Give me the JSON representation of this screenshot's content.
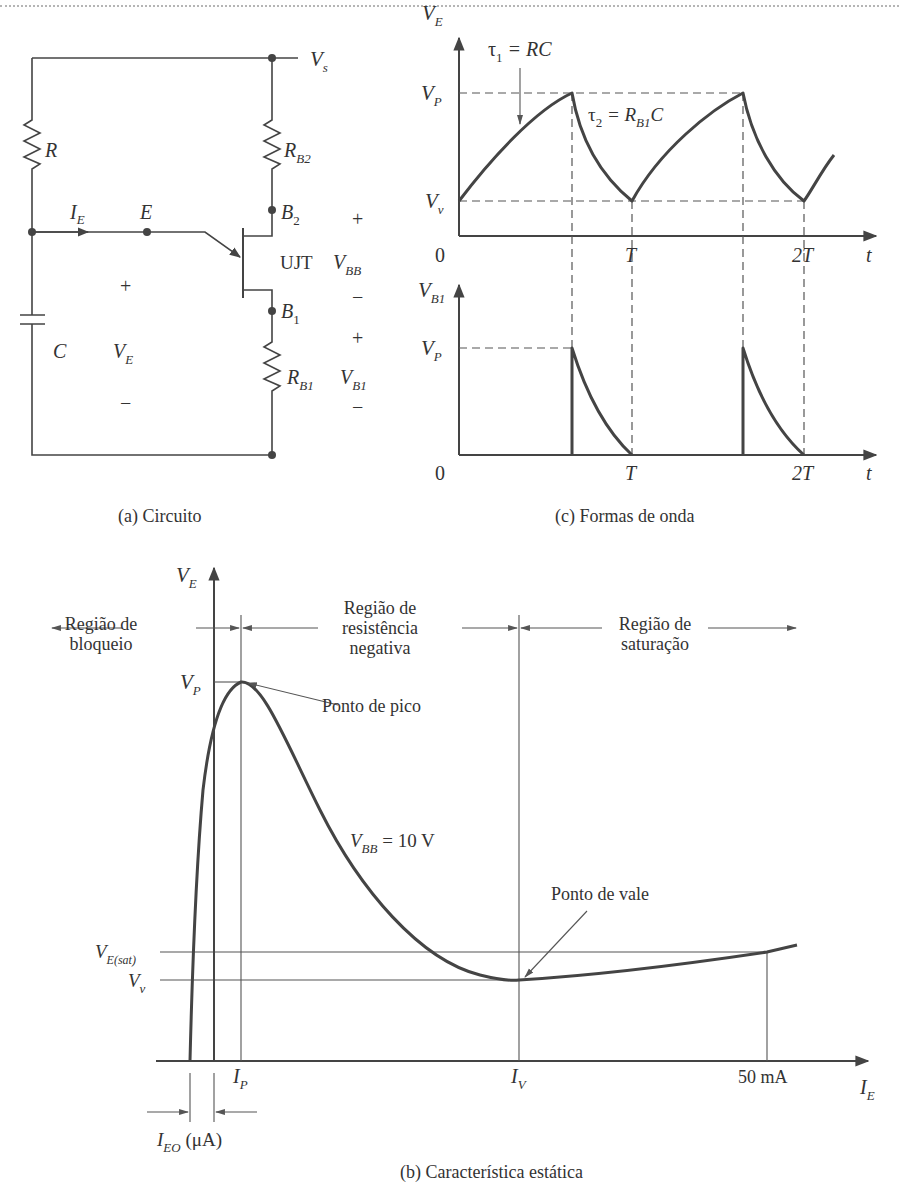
{
  "figure": {
    "panels": {
      "circuit": {
        "caption": "(a) Circuito",
        "labels": {
          "supply": "V",
          "supply_sub": "s",
          "resistor_r": "R",
          "resistor_rb2": "R",
          "resistor_rb2_sub": "B2",
          "resistor_rb1": "R",
          "resistor_rb1_sub": "B1",
          "capacitor": "C",
          "emitter_current": "I",
          "emitter_current_sub": "E",
          "emitter_node": "E",
          "base2": "B",
          "base2_sub": "2",
          "base1": "B",
          "base1_sub": "1",
          "device": "UJT",
          "vbb": "V",
          "vbb_sub": "BB",
          "vb1": "V",
          "vb1_sub": "B1",
          "ve": "V",
          "ve_sub": "E",
          "plus": "+",
          "minus": "−"
        }
      },
      "waveforms": {
        "caption": "(c) Formas de onda",
        "top": {
          "ylabel": "V",
          "ylabel_sub": "E",
          "vp": "V",
          "vp_sub": "P",
          "vv": "V",
          "vv_sub": "v",
          "tau1": "τ",
          "tau1_sub": "1",
          "tau1_eq": " = RC",
          "tau2": "τ",
          "tau2_sub": "2",
          "tau2_eq_a": " = R",
          "tau2_eq_sub": "B1",
          "tau2_eq_b": "C",
          "origin": "0",
          "t1": "T",
          "t2": "2T",
          "xlabel": "t"
        },
        "bottom": {
          "ylabel": "V",
          "ylabel_sub": "B1",
          "vp": "V",
          "vp_sub": "P",
          "origin": "0",
          "t1": "T",
          "t2": "2T",
          "xlabel": "t"
        }
      },
      "characteristic": {
        "caption": "(b) Característica estática",
        "ylabel": "V",
        "ylabel_sub": "E",
        "xlabel": "I",
        "xlabel_sub": "E",
        "region_cutoff_l1": "Região de",
        "region_cutoff_l2": "bloqueio",
        "region_negres_l1": "Região de",
        "region_negres_l2": "resistência",
        "region_negres_l3": "negativa",
        "region_sat_l1": "Região de",
        "region_sat_l2": "saturação",
        "vp": "V",
        "vp_sub": "P",
        "vesat": "V",
        "vesat_sub": "E(sat)",
        "vv": "V",
        "vv_sub": "v",
        "peak_point": "Ponto de pico",
        "valley_point": "Ponto de vale",
        "vbb_label": "V",
        "vbb_sub": "BB",
        "vbb_value": " = 10 V",
        "ip": "I",
        "ip_sub": "P",
        "iv": "I",
        "iv_sub": "V",
        "i50": "50 mA",
        "ieo": "I",
        "ieo_sub": "EO",
        "ieo_unit": " (μA)"
      }
    }
  }
}
